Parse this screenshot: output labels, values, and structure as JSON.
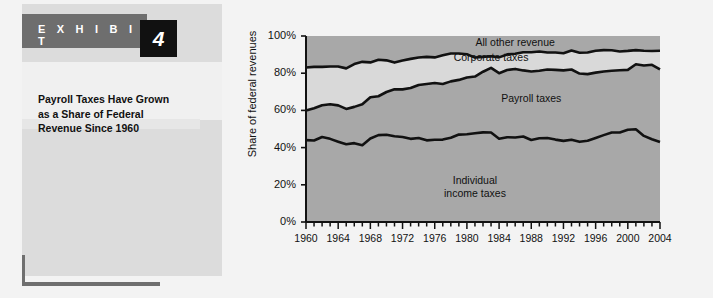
{
  "exhibit": {
    "banner_label": "E X H I B I T",
    "number": "4",
    "title": "Payroll Taxes Have Grown as a Share of Federal Revenue Since 1960",
    "title_line1": "Payroll Taxes Have Grown",
    "title_line2": "as a Share of Federal",
    "title_line3": "Revenue Since 1960"
  },
  "colors": {
    "banner_bg": "#6e6e6e",
    "number_bg": "#111111",
    "panel_bg": "#dcdcdc",
    "panel_inner_bg": "#f0f0f0",
    "page_bg": "#f3f3f3",
    "band_dark": "#a8a8a8",
    "band_light": "#d9d9d9",
    "line": "#111111"
  },
  "chart_data": {
    "type": "area",
    "title": "Payroll Taxes Have Grown as a Share of Federal Revenue Since 1960",
    "xlabel": "",
    "ylabel": "Share of federal revenues",
    "ylim": [
      0,
      100
    ],
    "xlim": [
      1960,
      2004
    ],
    "grid": false,
    "legend": "inline-annotations",
    "ytick_labels": [
      "0%",
      "20%",
      "40%",
      "60%",
      "80%",
      "100%"
    ],
    "ytick_values": [
      0,
      20,
      40,
      60,
      80,
      100
    ],
    "xtick_labels": [
      "1960",
      "1964",
      "1968",
      "1972",
      "1976",
      "1980",
      "1984",
      "1988",
      "1992",
      "1996",
      "2000",
      "2004"
    ],
    "xtick_values": [
      1960,
      1964,
      1968,
      1972,
      1976,
      1980,
      1984,
      1988,
      1992,
      1996,
      2000,
      2004
    ],
    "minor_xticks_every": 1,
    "annotations": [
      {
        "text": "All other revenue",
        "x": 1986,
        "y": 96
      },
      {
        "text": "Corporate taxes",
        "x": 1983,
        "y": 88
      },
      {
        "text": "Payroll taxes",
        "x": 1988,
        "y": 66
      },
      {
        "text": "Individual income taxes",
        "x": 1981,
        "y": 22
      }
    ],
    "x": [
      1960,
      1961,
      1962,
      1963,
      1964,
      1965,
      1966,
      1967,
      1968,
      1969,
      1970,
      1971,
      1972,
      1973,
      1974,
      1975,
      1976,
      1977,
      1978,
      1979,
      1980,
      1981,
      1982,
      1983,
      1984,
      1985,
      1986,
      1987,
      1988,
      1989,
      1990,
      1991,
      1992,
      1993,
      1994,
      1995,
      1996,
      1997,
      1998,
      1999,
      2000,
      2001,
      2002,
      2003,
      2004
    ],
    "series": [
      {
        "name": "Individual income taxes",
        "values": [
          44.0,
          43.8,
          45.7,
          44.7,
          43.2,
          41.8,
          42.4,
          41.3,
          44.9,
          46.7,
          46.9,
          46.1,
          45.7,
          44.7,
          45.2,
          43.9,
          44.2,
          44.3,
          45.3,
          47.0,
          47.2,
          47.7,
          48.2,
          48.1,
          44.8,
          45.6,
          45.4,
          46.0,
          44.1,
          45.0,
          45.2,
          44.3,
          43.6,
          44.2,
          43.1,
          43.7,
          45.2,
          46.7,
          48.1,
          48.1,
          49.6,
          49.9,
          46.3,
          44.5,
          43.0
        ]
      },
      {
        "name": "Payroll taxes",
        "values": [
          15.9,
          17.4,
          17.1,
          18.6,
          19.5,
          19.0,
          19.5,
          22.0,
          22.2,
          20.9,
          23.0,
          25.3,
          25.6,
          27.3,
          28.5,
          30.3,
          30.5,
          29.9,
          30.3,
          29.4,
          30.5,
          30.5,
          32.6,
          34.8,
          35.2,
          36.1,
          36.9,
          35.5,
          36.8,
          36.3,
          36.8,
          37.5,
          37.9,
          37.8,
          36.7,
          35.8,
          35.1,
          34.2,
          33.2,
          33.5,
          32.2,
          34.9,
          37.8,
          40.0,
          39.0
        ]
      },
      {
        "name": "Corporate taxes",
        "values": [
          23.2,
          22.2,
          20.6,
          20.3,
          20.9,
          21.8,
          23.0,
          22.8,
          18.7,
          19.6,
          17.0,
          14.3,
          15.5,
          15.7,
          14.7,
          14.6,
          13.8,
          15.4,
          15.0,
          14.2,
          12.5,
          10.2,
          8.0,
          6.2,
          8.5,
          8.4,
          8.2,
          9.8,
          10.4,
          10.4,
          9.1,
          9.3,
          9.2,
          10.2,
          11.2,
          11.6,
          11.8,
          11.5,
          11.0,
          10.1,
          10.2,
          7.6,
          8.0,
          7.4,
          10.1
        ]
      },
      {
        "name": "All other revenue",
        "values": [
          16.9,
          16.6,
          16.6,
          16.4,
          16.4,
          17.4,
          15.1,
          13.9,
          14.2,
          12.8,
          13.1,
          14.3,
          13.2,
          12.3,
          11.6,
          11.2,
          11.5,
          10.4,
          9.4,
          9.4,
          9.8,
          11.6,
          11.2,
          10.9,
          11.5,
          9.9,
          9.5,
          8.7,
          8.7,
          8.3,
          8.9,
          8.9,
          9.3,
          7.8,
          9.0,
          8.9,
          7.9,
          7.6,
          7.7,
          8.3,
          8.0,
          7.6,
          7.9,
          8.1,
          7.9
        ]
      }
    ],
    "cumulative_boundaries": {
      "individual_top": [
        44.0,
        43.8,
        45.7,
        44.7,
        43.2,
        41.8,
        42.4,
        41.3,
        44.9,
        46.7,
        46.9,
        46.1,
        45.7,
        44.7,
        45.2,
        43.9,
        44.2,
        44.3,
        45.3,
        47.0,
        47.2,
        47.7,
        48.2,
        48.1,
        44.8,
        45.6,
        45.4,
        46.0,
        44.1,
        45.0,
        45.2,
        44.3,
        43.6,
        44.2,
        43.1,
        43.7,
        45.2,
        46.7,
        48.1,
        48.1,
        49.6,
        49.9,
        46.3,
        44.5,
        43.0
      ],
      "payroll_top": [
        59.9,
        61.2,
        62.8,
        63.3,
        62.7,
        60.8,
        61.9,
        63.3,
        67.1,
        67.6,
        69.9,
        71.4,
        71.3,
        72.0,
        73.7,
        74.2,
        74.7,
        74.2,
        75.6,
        76.4,
        77.7,
        78.2,
        80.8,
        82.9,
        80.0,
        81.7,
        82.3,
        81.5,
        80.9,
        81.3,
        82.0,
        81.8,
        81.5,
        82.0,
        79.8,
        79.5,
        80.3,
        80.9,
        81.3,
        81.6,
        81.8,
        84.8,
        84.1,
        84.5,
        82.0
      ],
      "corporate_top": [
        83.1,
        83.4,
        83.4,
        83.6,
        83.6,
        82.6,
        84.9,
        86.1,
        85.8,
        87.2,
        86.9,
        85.7,
        86.8,
        87.7,
        88.4,
        88.8,
        88.5,
        89.6,
        90.6,
        90.6,
        90.2,
        88.4,
        88.8,
        89.1,
        88.5,
        90.1,
        90.5,
        91.3,
        91.3,
        91.7,
        91.1,
        91.1,
        90.7,
        92.2,
        91.0,
        91.1,
        92.1,
        92.4,
        92.3,
        91.7,
        92.0,
        92.4,
        92.1,
        91.9,
        92.1
      ]
    }
  }
}
